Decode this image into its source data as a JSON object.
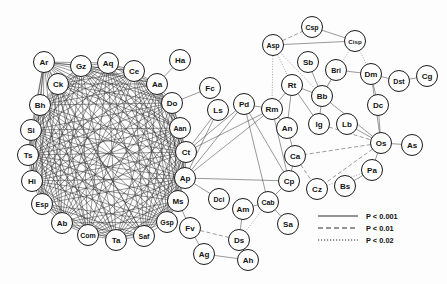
{
  "figure": {
    "background_color": "#fdfdfd",
    "node_fill": "#ffffff",
    "node_stroke": "#1a1a1a",
    "edge_color": "#2b2b2b",
    "node_radius": 10.5,
    "width": 447,
    "height": 284
  },
  "legend": {
    "items": [
      {
        "style": "solid",
        "label": "P < 0.001"
      },
      {
        "style": "dashed",
        "label": "P < 0.01"
      },
      {
        "style": "dotted",
        "label": "P < 0.02"
      }
    ],
    "x": 318,
    "y": 216
  },
  "chart_data": {
    "type": "diagram",
    "subtype": "node-link-network",
    "node_count": 52,
    "nodes": [
      {
        "id": "Ar",
        "label": "Ar",
        "x": 44,
        "y": 62,
        "cluster": "left"
      },
      {
        "id": "Ck",
        "label": "Ck",
        "x": 58,
        "y": 84,
        "cluster": "left"
      },
      {
        "id": "Bh",
        "label": "Bh",
        "x": 40,
        "y": 105,
        "cluster": "left"
      },
      {
        "id": "Si",
        "label": "Si",
        "x": 31,
        "y": 130,
        "cluster": "left"
      },
      {
        "id": "Ts",
        "label": "Ts",
        "x": 28,
        "y": 155,
        "cluster": "left"
      },
      {
        "id": "Hi",
        "label": "Hi",
        "x": 32,
        "y": 181,
        "cluster": "left"
      },
      {
        "id": "Esp",
        "label": "Esp",
        "x": 42,
        "y": 204,
        "cluster": "left"
      },
      {
        "id": "Ab",
        "label": "Ab",
        "x": 62,
        "y": 223,
        "cluster": "left"
      },
      {
        "id": "Com",
        "label": "Com",
        "x": 88,
        "y": 235,
        "cluster": "left"
      },
      {
        "id": "Ta",
        "label": "Ta",
        "x": 116,
        "y": 240,
        "cluster": "left"
      },
      {
        "id": "Saf",
        "label": "Saf",
        "x": 144,
        "y": 236,
        "cluster": "left"
      },
      {
        "id": "Gsp",
        "label": "Gsp",
        "x": 167,
        "y": 222,
        "cluster": "left"
      },
      {
        "id": "Ms",
        "label": "Ms",
        "x": 178,
        "y": 201,
        "cluster": "left"
      },
      {
        "id": "Ap",
        "label": "Ap",
        "x": 185,
        "y": 178,
        "cluster": "left"
      },
      {
        "id": "Ct",
        "label": "Ct",
        "x": 186,
        "y": 152,
        "cluster": "left"
      },
      {
        "id": "Aan",
        "label": "Aan",
        "x": 180,
        "y": 128,
        "cluster": "left"
      },
      {
        "id": "Do",
        "label": "Do",
        "x": 172,
        "y": 103,
        "cluster": "left"
      },
      {
        "id": "Aa",
        "label": "Aa",
        "x": 157,
        "y": 84,
        "cluster": "left"
      },
      {
        "id": "Ce",
        "label": "Ce",
        "x": 134,
        "y": 71,
        "cluster": "left"
      },
      {
        "id": "Aq",
        "label": "Aq",
        "x": 108,
        "y": 63,
        "cluster": "left"
      },
      {
        "id": "Gz",
        "label": "Gz",
        "x": 81,
        "y": 66,
        "cluster": "left"
      },
      {
        "id": "Ha",
        "label": "Ha",
        "x": 180,
        "y": 60,
        "cluster": "periphery"
      },
      {
        "id": "Fc",
        "label": "Fc",
        "x": 210,
        "y": 88,
        "cluster": "periphery"
      },
      {
        "id": "Ls",
        "label": "Ls",
        "x": 218,
        "y": 110,
        "cluster": "bridge"
      },
      {
        "id": "Pd",
        "label": "Pd",
        "x": 244,
        "y": 104,
        "cluster": "bridge"
      },
      {
        "id": "Rm",
        "label": "Rm",
        "x": 272,
        "y": 109,
        "cluster": "bridge"
      },
      {
        "id": "Asp",
        "label": "Asp",
        "x": 273,
        "y": 45,
        "cluster": "right"
      },
      {
        "id": "Csp",
        "label": "Csp",
        "x": 312,
        "y": 27,
        "cluster": "right"
      },
      {
        "id": "Cisp",
        "label": "Cisp",
        "x": 355,
        "y": 41,
        "cluster": "right"
      },
      {
        "id": "Sb",
        "label": "Sb",
        "x": 308,
        "y": 62,
        "cluster": "right"
      },
      {
        "id": "Bri",
        "label": "Bri",
        "x": 336,
        "y": 70,
        "cluster": "right"
      },
      {
        "id": "Dm",
        "label": "Dm",
        "x": 371,
        "y": 74,
        "cluster": "right"
      },
      {
        "id": "Dst",
        "label": "Dst",
        "x": 399,
        "y": 81,
        "cluster": "right"
      },
      {
        "id": "Cg",
        "label": "Cg",
        "x": 427,
        "y": 76,
        "cluster": "right"
      },
      {
        "id": "Rt",
        "label": "Rt",
        "x": 292,
        "y": 85,
        "cluster": "right"
      },
      {
        "id": "Bb",
        "label": "Bb",
        "x": 322,
        "y": 96,
        "cluster": "right"
      },
      {
        "id": "Dc",
        "label": "Dc",
        "x": 378,
        "y": 105,
        "cluster": "right"
      },
      {
        "id": "An",
        "label": "An",
        "x": 287,
        "y": 128,
        "cluster": "right"
      },
      {
        "id": "Ig",
        "label": "Ig",
        "x": 319,
        "y": 124,
        "cluster": "right"
      },
      {
        "id": "Lb",
        "label": "Lb",
        "x": 347,
        "y": 124,
        "cluster": "right"
      },
      {
        "id": "Os",
        "label": "Os",
        "x": 381,
        "y": 143,
        "cluster": "right"
      },
      {
        "id": "As",
        "label": "As",
        "x": 412,
        "y": 145,
        "cluster": "right"
      },
      {
        "id": "Ca",
        "label": "Ca",
        "x": 295,
        "y": 156,
        "cluster": "right"
      },
      {
        "id": "Pa",
        "label": "Pa",
        "x": 372,
        "y": 170,
        "cluster": "right"
      },
      {
        "id": "Cp",
        "label": "Cp",
        "x": 289,
        "y": 181,
        "cluster": "right"
      },
      {
        "id": "Cz",
        "label": "Cz",
        "x": 317,
        "y": 189,
        "cluster": "right"
      },
      {
        "id": "Bs",
        "label": "Bs",
        "x": 345,
        "y": 186,
        "cluster": "right"
      },
      {
        "id": "Dci",
        "label": "Dci",
        "x": 219,
        "y": 199,
        "cluster": "bottom"
      },
      {
        "id": "Am",
        "label": "Am",
        "x": 243,
        "y": 209,
        "cluster": "bottom"
      },
      {
        "id": "Cab",
        "label": "Cab",
        "x": 268,
        "y": 202,
        "cluster": "bottom"
      },
      {
        "id": "Sa",
        "label": "Sa",
        "x": 288,
        "y": 224,
        "cluster": "bottom"
      },
      {
        "id": "Fv",
        "label": "Fv",
        "x": 190,
        "y": 228,
        "cluster": "bottom"
      },
      {
        "id": "Ds",
        "label": "Ds",
        "x": 239,
        "y": 240,
        "cluster": "bottom"
      },
      {
        "id": "Ag",
        "label": "Ag",
        "x": 204,
        "y": 254,
        "cluster": "bottom"
      },
      {
        "id": "Ah",
        "label": "Ah",
        "x": 248,
        "y": 260,
        "cluster": "bottom"
      }
    ],
    "left_cluster_ring": [
      "Ar",
      "Ck",
      "Bh",
      "Si",
      "Ts",
      "Hi",
      "Esp",
      "Ab",
      "Com",
      "Ta",
      "Saf",
      "Gsp",
      "Ms",
      "Ap",
      "Ct",
      "Aan",
      "Do",
      "Aa",
      "Ce",
      "Aq",
      "Gz"
    ],
    "left_cluster_note": "near-complete mesh of solid P < 0.001 edges among ring members",
    "edges": [
      {
        "source": "Ha",
        "target": "Aa",
        "style": "solid"
      },
      {
        "source": "Fc",
        "target": "Do",
        "style": "solid"
      },
      {
        "source": "Ls",
        "target": "Ct",
        "style": "solid"
      },
      {
        "source": "Ls",
        "target": "Ap",
        "style": "solid"
      },
      {
        "source": "Pd",
        "target": "Ct",
        "style": "solid"
      },
      {
        "source": "Pd",
        "target": "Ap",
        "style": "solid"
      },
      {
        "source": "Pd",
        "target": "Cp",
        "style": "solid"
      },
      {
        "source": "Pd",
        "target": "Cab",
        "style": "solid"
      },
      {
        "source": "Pd",
        "target": "Rm",
        "style": "solid"
      },
      {
        "source": "Rm",
        "target": "Ct",
        "style": "solid"
      },
      {
        "source": "Rm",
        "target": "Ap",
        "style": "solid"
      },
      {
        "source": "Rm",
        "target": "An",
        "style": "solid"
      },
      {
        "source": "Rm",
        "target": "Rt",
        "style": "solid"
      },
      {
        "source": "Rm",
        "target": "Cp",
        "style": "solid"
      },
      {
        "source": "Rm",
        "target": "Asp",
        "style": "dotted"
      },
      {
        "source": "Asp",
        "target": "Csp",
        "style": "dashed"
      },
      {
        "source": "Asp",
        "target": "Cisp",
        "style": "solid"
      },
      {
        "source": "Csp",
        "target": "Cisp",
        "style": "solid"
      },
      {
        "source": "Asp",
        "target": "Rt",
        "style": "dotted"
      },
      {
        "source": "Asp",
        "target": "Bb",
        "style": "dotted"
      },
      {
        "source": "Cisp",
        "target": "Bb",
        "style": "dotted"
      },
      {
        "source": "Cisp",
        "target": "Dm",
        "style": "dotted"
      },
      {
        "source": "Sb",
        "target": "Bb",
        "style": "solid"
      },
      {
        "source": "Bri",
        "target": "Bb",
        "style": "solid"
      },
      {
        "source": "Bri",
        "target": "Dm",
        "style": "solid"
      },
      {
        "source": "Rt",
        "target": "Bb",
        "style": "solid"
      },
      {
        "source": "Rt",
        "target": "An",
        "style": "solid"
      },
      {
        "source": "Rt",
        "target": "Ig",
        "style": "solid"
      },
      {
        "source": "Bb",
        "target": "Ig",
        "style": "solid"
      },
      {
        "source": "Bb",
        "target": "Os",
        "style": "solid"
      },
      {
        "source": "Dm",
        "target": "Dst",
        "style": "solid"
      },
      {
        "source": "Dm",
        "target": "Dc",
        "style": "solid"
      },
      {
        "source": "Dm",
        "target": "Os",
        "style": "solid"
      },
      {
        "source": "Dst",
        "target": "Cg",
        "style": "solid"
      },
      {
        "source": "Dc",
        "target": "Os",
        "style": "solid"
      },
      {
        "source": "Ig",
        "target": "Os",
        "style": "dashed"
      },
      {
        "source": "Lb",
        "target": "Os",
        "style": "solid"
      },
      {
        "source": "Os",
        "target": "As",
        "style": "solid"
      },
      {
        "source": "Os",
        "target": "Pa",
        "style": "solid"
      },
      {
        "source": "Os",
        "target": "Ca",
        "style": "dashed"
      },
      {
        "source": "Os",
        "target": "Cz",
        "style": "dashed"
      },
      {
        "source": "Pa",
        "target": "Bs",
        "style": "solid"
      },
      {
        "source": "Pa",
        "target": "Cz",
        "style": "dotted"
      },
      {
        "source": "Ca",
        "target": "Cp",
        "style": "solid"
      },
      {
        "source": "Ca",
        "target": "Cz",
        "style": "dashed"
      },
      {
        "source": "An",
        "target": "Ca",
        "style": "solid"
      },
      {
        "source": "Cp",
        "target": "Cab",
        "style": "solid"
      },
      {
        "source": "Cp",
        "target": "Ap",
        "style": "solid"
      },
      {
        "source": "Cab",
        "target": "Am",
        "style": "solid"
      },
      {
        "source": "Cab",
        "target": "Sa",
        "style": "solid"
      },
      {
        "source": "Cab",
        "target": "Ds",
        "style": "dotted"
      },
      {
        "source": "Am",
        "target": "Ds",
        "style": "solid"
      },
      {
        "source": "Dci",
        "target": "Ap",
        "style": "solid"
      },
      {
        "source": "Fv",
        "target": "Ms",
        "style": "solid"
      },
      {
        "source": "Fv",
        "target": "Ds",
        "style": "dashed"
      },
      {
        "source": "Fv",
        "target": "Ag",
        "style": "solid"
      },
      {
        "source": "Ag",
        "target": "Ah",
        "style": "solid"
      },
      {
        "source": "Ds",
        "target": "Ah",
        "style": "solid"
      }
    ]
  }
}
